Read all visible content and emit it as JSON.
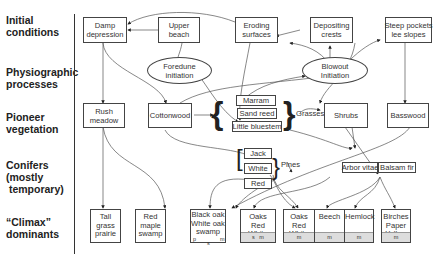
{
  "rows": [
    {
      "label": "Initial\nconditions"
    },
    {
      "label": "Physiographic\nprocesses"
    },
    {
      "label": "Pioneer\nvegetation"
    },
    {
      "label": "Conifers\n(mostly\n temporary)"
    },
    {
      "label": "“Climax”\ndominants"
    }
  ],
  "initial": {
    "damp": "Damp\ndepression",
    "upper_beach": "Upper\nbeach",
    "eroding": "Eroding\nsurfaces",
    "depositing": "Depositing\ncrests",
    "steep": "Steep pockets\nlee slopes"
  },
  "processes": {
    "foredune": "Foredune\ninitiation",
    "blowout": "Blowout\nInitiation"
  },
  "pioneer": {
    "rush": "Rush\nmeadow",
    "cottonwood": "Cottonwood",
    "marram": "Marram",
    "sand_reed": "Sand reed",
    "little_bluestem": "Little bluestem",
    "grasses": "Grasses",
    "shrubs": "Shrubs",
    "basswood": "Basswood"
  },
  "conifers": {
    "jack": "Jack",
    "white": "White",
    "red": "Red",
    "pines": "Pines",
    "arbor_vitae": "Arbor vitae",
    "balsam_fir": "Balsam fir"
  },
  "climax": {
    "tall_grass": "Tall\ngrass\nprairie",
    "red_maple": "Red\nmaple\nswamp",
    "black_oak": "Black oak\nWhite oak\nswamp",
    "black_oak_marks": {
      "p": "p",
      "s": "s",
      "m": "m"
    },
    "oaks1": "Oaks\nRed\nWhite",
    "oaks1_foot": "s   m",
    "oaks2": "Oaks\nRed\nWhite",
    "oaks2_foot": "m",
    "beech": "Beech",
    "beech_foot": "m",
    "hemlock": "Hemlock",
    "hemlock_foot": "m",
    "birches": "Birches\nPaper\nYellow",
    "birches_foot": "m"
  }
}
